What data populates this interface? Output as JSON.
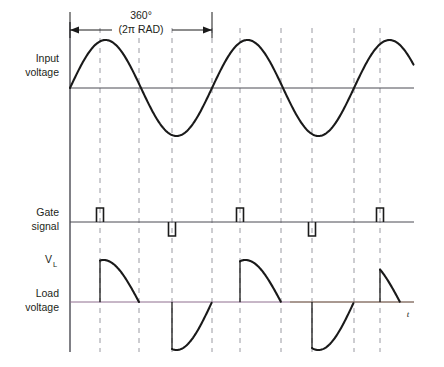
{
  "figure": {
    "background_color": "#ffffff",
    "curve_color": "#1a1a1a",
    "axis_color": "#4a4a52",
    "dash_color": "#9a9aa2",
    "load_baseline_color": "#8f6f8f",
    "t_axis_color": "#8a7a5a"
  },
  "labels": {
    "input_voltage_line1": "Input",
    "input_voltage_line2": "voltage",
    "gate_signal_line1": "Gate",
    "gate_signal_line2": "signal",
    "vl_main": "V",
    "vl_sub": "L",
    "load_voltage_line1": "Load",
    "load_voltage_line2": "voltage",
    "time_axis": "t"
  },
  "dimension": {
    "line1": "360°",
    "line2": "(2π RAD)",
    "x_start": 70,
    "x_end": 212
  },
  "chart_data": {
    "type": "line",
    "xlabel": "t",
    "ylabel": "",
    "grid": false,
    "legend_position": "none",
    "axis": {
      "origin_x": 70,
      "right_edge": 414,
      "top_y": 22,
      "bottom_y": 352,
      "period_px": 142
    },
    "panels": [
      {
        "name": "input-voltage",
        "baseline_y": 88,
        "amplitude_px": 48,
        "waveform": "sine",
        "cycles": 2.45,
        "zero_crossings_px": [
          70,
          141,
          212,
          283,
          354,
          425
        ],
        "peaks_px": [
          105,
          247,
          389
        ],
        "troughs_px": [
          176,
          318
        ]
      },
      {
        "name": "gate-signal",
        "baseline_y": 222,
        "pulse_width_px": 7,
        "pulse_height_px": 14,
        "pulses": [
          {
            "x": 100,
            "polarity": "positive"
          },
          {
            "x": 172,
            "polarity": "negative"
          },
          {
            "x": 240,
            "polarity": "positive"
          },
          {
            "x": 312,
            "polarity": "negative"
          },
          {
            "x": 380,
            "polarity": "positive"
          }
        ]
      },
      {
        "name": "load-voltage",
        "baseline_y": 302,
        "segments": [
          {
            "start_x": 100,
            "end_x": 139,
            "polarity": "positive",
            "peak_px": 42
          },
          {
            "start_x": 172,
            "end_x": 212,
            "polarity": "negative",
            "peak_px": 48
          },
          {
            "start_x": 240,
            "end_x": 281,
            "polarity": "positive",
            "peak_px": 42
          },
          {
            "start_x": 312,
            "end_x": 354,
            "polarity": "negative",
            "peak_px": 48
          },
          {
            "start_x": 380,
            "end_x": 400,
            "polarity": "positive",
            "peak_px": 42
          }
        ]
      }
    ],
    "dashed_verticals_px": [
      100,
      139,
      172,
      212,
      240,
      281,
      312,
      354,
      380
    ],
    "annotations": [
      {
        "text": "360°",
        "x": 141,
        "y": 18
      },
      {
        "text": "(2π RAD)",
        "x": 141,
        "y": 32
      }
    ]
  }
}
